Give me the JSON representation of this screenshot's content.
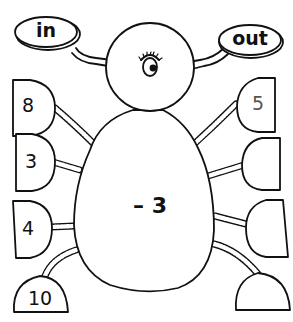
{
  "diagram": {
    "type": "function-machine-spider",
    "input_label": "in",
    "output_label": "out",
    "operation": "– 3",
    "inputs": [
      "8",
      "3",
      "4",
      "10"
    ],
    "outputs": [
      "5",
      "",
      "",
      ""
    ]
  },
  "colors": {
    "stroke": "#111111",
    "fill": "#ffffff"
  }
}
